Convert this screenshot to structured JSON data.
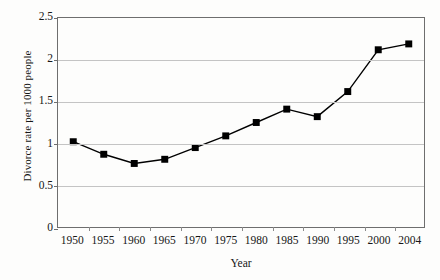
{
  "chart_data": {
    "type": "line",
    "title": "",
    "xlabel": "Year",
    "ylabel": "Divorce rate per 1000 people",
    "categories": [
      "1950",
      "1955",
      "1960",
      "1965",
      "1970",
      "1975",
      "1980",
      "1985",
      "1990",
      "1995",
      "2000",
      "2004"
    ],
    "values": [
      1.02,
      0.87,
      0.76,
      0.81,
      0.95,
      1.09,
      1.25,
      1.41,
      1.32,
      1.62,
      2.12,
      2.19
    ],
    "x": [
      1950,
      1955,
      1960,
      1965,
      1970,
      1975,
      1980,
      1985,
      1990,
      1995,
      2000,
      2004
    ],
    "ylim": [
      0,
      2.5
    ],
    "yticks": [
      "0",
      "0.5",
      "1",
      "1.5",
      "2",
      "2.5"
    ],
    "ytick_values": [
      0,
      0.5,
      1,
      1.5,
      2,
      2.5
    ],
    "grid": "horizontal",
    "legend": "none",
    "marker": "square",
    "marker_color": "#000000",
    "line_color": "#000000"
  }
}
